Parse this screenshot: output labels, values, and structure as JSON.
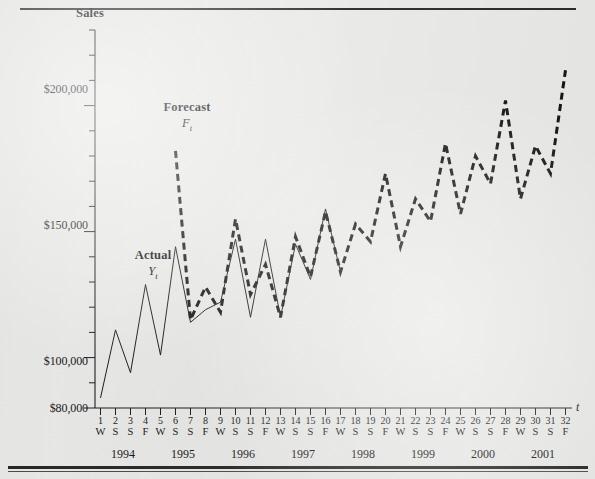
{
  "figure": {
    "background_color": "#e9e9e7",
    "ink_color": "#151515",
    "rules": {
      "top": true,
      "bottom": true
    }
  },
  "axes": {
    "y_title": "Sales",
    "x_title": "t",
    "y_tick_labels": [
      "$200,000",
      "$150,000",
      "$100,000",
      "$80,000"
    ],
    "y_tick_values": [
      200000,
      150000,
      100000,
      80000
    ],
    "y_minor_step": 10000,
    "y_min": 80000,
    "y_max": 230000
  },
  "annotations": [
    {
      "name": "Forecast",
      "symbol": "F",
      "subscript": "t",
      "left": 152,
      "top": 100
    },
    {
      "name": "Actual",
      "symbol": "Y",
      "subscript": "t",
      "left": 124,
      "top": 248
    }
  ],
  "x_axis": {
    "periods": [
      1,
      2,
      3,
      4,
      5,
      6,
      7,
      8,
      9,
      10,
      11,
      12,
      13,
      14,
      15,
      16,
      17,
      18,
      19,
      20,
      21,
      22,
      23,
      24,
      25,
      26,
      27,
      28,
      29,
      30,
      31,
      32
    ],
    "seasons": [
      "W",
      "S",
      "S",
      "F",
      "W",
      "S",
      "S",
      "F",
      "W",
      "S",
      "S",
      "F",
      "W",
      "S",
      "S",
      "F",
      "W",
      "S",
      "S",
      "F",
      "W",
      "S",
      "S",
      "F",
      "W",
      "S",
      "S",
      "F",
      "W",
      "S",
      "S",
      "F"
    ],
    "years": [
      "1994",
      "1995",
      "1996",
      "1997",
      "1998",
      "1999",
      "2000",
      "2001"
    ]
  },
  "chart_data": {
    "type": "line",
    "title": "",
    "xlabel": "t",
    "ylabel": "Sales",
    "ylim": [
      80000,
      230000
    ],
    "xlim": [
      1,
      32
    ],
    "grid": false,
    "legend_position": "inline-annotation",
    "x": [
      1,
      2,
      3,
      4,
      5,
      6,
      7,
      8,
      9,
      10,
      11,
      12,
      13,
      14,
      15,
      16,
      17,
      18,
      19,
      20,
      21,
      22,
      23,
      24,
      25,
      26,
      27,
      28,
      29,
      30,
      31,
      32
    ],
    "x_tick_labels": [
      "1",
      "2",
      "3",
      "4",
      "5",
      "6",
      "7",
      "8",
      "9",
      "10",
      "11",
      "12",
      "13",
      "14",
      "15",
      "16",
      "17",
      "18",
      "19",
      "20",
      "21",
      "22",
      "23",
      "24",
      "25",
      "26",
      "27",
      "28",
      "29",
      "30",
      "31",
      "32"
    ],
    "x_season_labels": [
      "W",
      "S",
      "S",
      "F",
      "W",
      "S",
      "S",
      "F",
      "W",
      "S",
      "S",
      "F",
      "W",
      "S",
      "S",
      "F",
      "W",
      "S",
      "S",
      "F",
      "W",
      "S",
      "S",
      "F",
      "W",
      "S",
      "S",
      "F",
      "W",
      "S",
      "S",
      "F"
    ],
    "x_year_groups": [
      "1994",
      "1995",
      "1996",
      "1997",
      "1998",
      "1999",
      "2000",
      "2001"
    ],
    "series": [
      {
        "name": "Actual",
        "symbol": "Yt",
        "style": "solid-thin",
        "color": "#1a1a1a",
        "values": [
          84000,
          111000,
          94000,
          129000,
          101000,
          144000,
          114000,
          119000,
          122000,
          147000,
          116000,
          147000,
          116000,
          145000,
          131000,
          159000,
          134000,
          null,
          null,
          null,
          null,
          null,
          null,
          null,
          null,
          null,
          null,
          null,
          null,
          null,
          null,
          null
        ]
      },
      {
        "name": "Forecast",
        "symbol": "Ft",
        "style": "dashed-thick",
        "color": "#141414",
        "values": [
          null,
          null,
          null,
          null,
          null,
          182000,
          115000,
          128000,
          118000,
          155000,
          125000,
          137000,
          116000,
          148000,
          132000,
          158000,
          134000,
          153000,
          146000,
          173000,
          144000,
          163000,
          154000,
          185000,
          157000,
          180000,
          169000,
          202000,
          163000,
          184000,
          173000,
          214000
        ]
      }
    ]
  }
}
